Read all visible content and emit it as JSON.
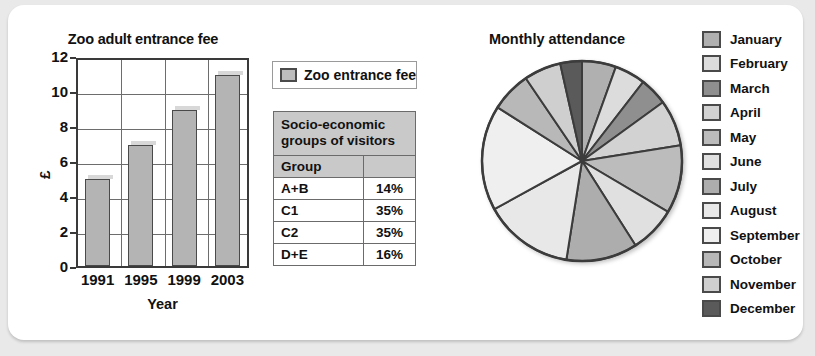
{
  "chart_data": [
    {
      "type": "bar",
      "title": "Zoo adult entrance fee",
      "xlabel": "Year",
      "ylabel": "£",
      "categories": [
        "1991",
        "1995",
        "1999",
        "2003"
      ],
      "values": [
        5,
        7,
        9,
        11
      ],
      "ylim": [
        0,
        12
      ],
      "yticks": [
        "0",
        "2",
        "4",
        "6",
        "8",
        "10",
        "12"
      ],
      "grid": true,
      "legend_position": "right",
      "legend": [
        {
          "label": "Zoo entrance fee",
          "color": "#bdbdbd"
        }
      ]
    },
    {
      "type": "pie",
      "title": "Monthly attendance",
      "legend_position": "right",
      "categories": [
        "January",
        "February",
        "March",
        "April",
        "May",
        "June",
        "July",
        "August",
        "September",
        "October",
        "November",
        "December"
      ],
      "values": [
        5.5,
        5.0,
        4.5,
        7.5,
        11.0,
        7.5,
        11.5,
        14.5,
        17.0,
        6.5,
        6.0,
        3.5
      ],
      "colors": [
        "#b0b0b0",
        "#dcdcdc",
        "#8f8f8f",
        "#d2d2d2",
        "#bcbcbc",
        "#e0e0e0",
        "#adadad",
        "#e8e8e8",
        "#efefef",
        "#b8b8b8",
        "#cfcfcf",
        "#5a5a5a"
      ]
    },
    {
      "type": "table",
      "title": "Socio-economic groups of visitors",
      "columns": [
        "Group",
        ""
      ],
      "rows": [
        [
          "A+B",
          "14%"
        ],
        [
          "C1",
          "35%"
        ],
        [
          "C2",
          "35%"
        ],
        [
          "D+E",
          "16%"
        ]
      ]
    }
  ],
  "bar": {
    "title": "Zoo adult entrance fee",
    "xlabel": "Year",
    "ylabel": "£",
    "yticks": [
      "12",
      "10",
      "8",
      "6",
      "4",
      "2",
      "0"
    ],
    "categories": [
      "1991",
      "1995",
      "1999",
      "2003"
    ],
    "values": [
      5,
      7,
      9,
      11
    ],
    "legend_label": "Zoo entrance fee"
  },
  "table": {
    "caption": "Socio-economic groups of visitors",
    "header": {
      "group": "Group",
      "value": ""
    },
    "rows": [
      {
        "group": "A+B",
        "value": "14%"
      },
      {
        "group": "C1",
        "value": "35%"
      },
      {
        "group": "C2",
        "value": "35%"
      },
      {
        "group": "D+E",
        "value": "16%"
      }
    ]
  },
  "pie": {
    "title": "Monthly attendance",
    "legend": [
      {
        "label": "January",
        "color": "#b0b0b0"
      },
      {
        "label": "February",
        "color": "#dcdcdc"
      },
      {
        "label": "March",
        "color": "#8f8f8f"
      },
      {
        "label": "April",
        "color": "#d2d2d2"
      },
      {
        "label": "May",
        "color": "#bcbcbc"
      },
      {
        "label": "June",
        "color": "#e0e0e0"
      },
      {
        "label": "July",
        "color": "#adadad"
      },
      {
        "label": "August",
        "color": "#e8e8e8"
      },
      {
        "label": "September",
        "color": "#efefef"
      },
      {
        "label": "October",
        "color": "#b8b8b8"
      },
      {
        "label": "November",
        "color": "#cfcfcf"
      },
      {
        "label": "December",
        "color": "#5a5a5a"
      }
    ]
  }
}
